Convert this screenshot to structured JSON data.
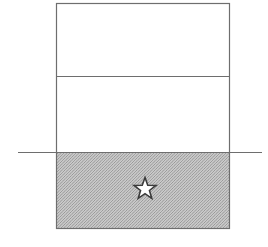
{
  "canvas": {
    "width": 268,
    "height": 247,
    "background": "#ffffff"
  },
  "diagram": {
    "stroke_color": "#6e6e6e",
    "stroke_color_dark": "#555555",
    "stipple_color": "#9a9a9a",
    "stipple_background": "#c9c9c9",
    "star_fill": "#ffffff",
    "star_stroke": "#3b3b3b"
  },
  "shapes": {
    "outer_rectangle": {
      "name": "outer-rectangle",
      "x": 56.5,
      "y": 3.5,
      "width": 173,
      "height": 225,
      "stroke_width": 1.2,
      "fill": "none",
      "label": "outer rectangle"
    },
    "divider_line": {
      "name": "upper-divider-line",
      "x1": 56.5,
      "y1": 76.5,
      "x2": 229.5,
      "y2": 76.5,
      "stroke_width": 1.2,
      "label": "upper horizontal divider"
    },
    "grade_line": {
      "name": "grade-line",
      "x1": 18,
      "y1": 152.5,
      "x2": 262,
      "y2": 152.5,
      "stroke_width": 1.1,
      "label": "horizontal grade line extending past rectangle"
    },
    "shaded_region": {
      "name": "shaded-lower-region",
      "x": 57,
      "y": 153,
      "width": 172,
      "height": 75,
      "label": "stippled gray lower region"
    },
    "star": {
      "name": "star-marker",
      "center_x": 145,
      "center_y": 189,
      "outer_radius": 11.5,
      "inner_radius": 4.7,
      "points": 5,
      "stroke_width": 1.6,
      "label": "five-pointed star marker"
    }
  }
}
